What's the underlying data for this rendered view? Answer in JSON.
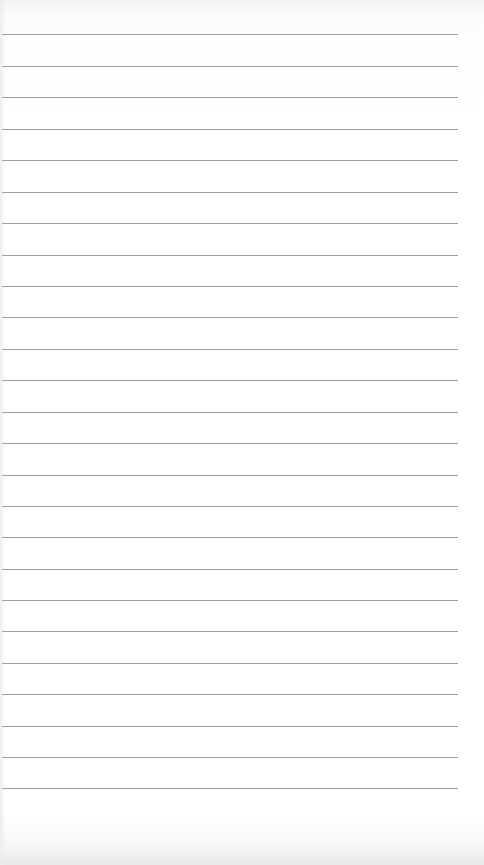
{
  "sheet": {
    "type": "lined-paper",
    "text": "",
    "line_color": "#8e8e8e",
    "background_color": "#ffffff",
    "line_count": 25,
    "line_x_start": 2,
    "line_x_end": 458,
    "line_positions_y": [
      34,
      66,
      97,
      129,
      160,
      192,
      223,
      255,
      286,
      317,
      349,
      380,
      412,
      443,
      475,
      506,
      537,
      569,
      600,
      631,
      663,
      694,
      726,
      757,
      788
    ]
  }
}
